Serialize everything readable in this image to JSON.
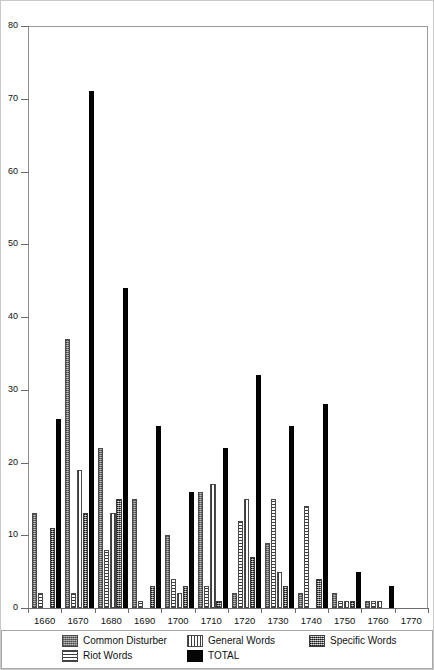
{
  "chart_data": {
    "type": "bar",
    "title": "",
    "xlabel": "",
    "ylabel": "",
    "ylim": [
      0,
      80
    ],
    "ytick_step": 10,
    "yticks": [
      0,
      10,
      20,
      30,
      40,
      50,
      60,
      70,
      80
    ],
    "grid": false,
    "legend_position": "bottom",
    "categories": [
      "1660",
      "1670",
      "1680",
      "1690",
      "1700",
      "1710",
      "1720",
      "1730",
      "1740",
      "1750",
      "1760"
    ],
    "xtick_labels": [
      "1660",
      "1670",
      "1680",
      "1690",
      "1700",
      "1710",
      "1720",
      "1730",
      "1740",
      "1750",
      "1760",
      "1770"
    ],
    "series": [
      {
        "name": "Common Disturber",
        "pattern": "p-common",
        "color": "#8e8e8e",
        "values": [
          13,
          37,
          22,
          15,
          10,
          16,
          2,
          9,
          2,
          2,
          1
        ]
      },
      {
        "name": "Riot Words",
        "pattern": "p-riot",
        "color": "#f2f2f2",
        "values": [
          2,
          2,
          8,
          1,
          4,
          3,
          12,
          15,
          14,
          1,
          1
        ]
      },
      {
        "name": "General Words",
        "pattern": "p-general",
        "color": "#ffffff",
        "values": [
          0,
          19,
          13,
          0,
          2,
          17,
          15,
          5,
          0,
          1,
          1
        ]
      },
      {
        "name": "Specific Words",
        "pattern": "p-specific",
        "color": "#767676",
        "values": [
          11,
          13,
          15,
          3,
          3,
          1,
          7,
          3,
          4,
          1,
          0
        ]
      },
      {
        "name": "TOTAL",
        "pattern": "p-total",
        "color": "#050505",
        "values": [
          26,
          71,
          44,
          25,
          16,
          22,
          32,
          25,
          28,
          5,
          3
        ]
      }
    ]
  },
  "legend": {
    "items": [
      {
        "label": "Common Disturber",
        "pattern": "p-common"
      },
      {
        "label": "General Words",
        "pattern": "p-general"
      },
      {
        "label": "Specific Words",
        "pattern": "p-specific"
      },
      {
        "label": "Riot Words",
        "pattern": "p-riot"
      },
      {
        "label": "TOTAL",
        "pattern": "p-total"
      }
    ]
  }
}
